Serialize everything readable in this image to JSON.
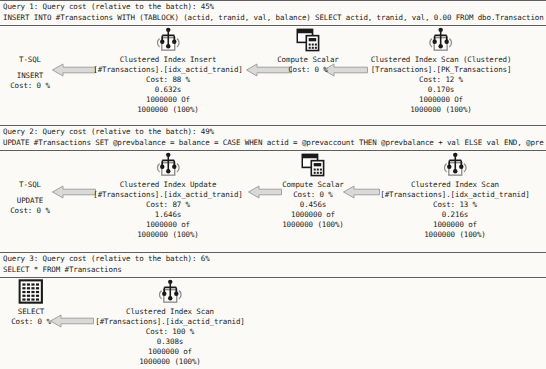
{
  "app": {
    "title": "SSMS graphical execution plan",
    "batch_query_count": 3
  },
  "colors": {
    "background": "#fbfaf6",
    "text": "#1b1b1b",
    "separator": "#5f5f5f",
    "arrow_fill": "#d9dad7",
    "arrow_stroke": "#9a9a98",
    "icon_ink": "#1a1a1a",
    "icon_box": "#8f8f8f"
  },
  "icons": {
    "clustered-index": "clustered-index-icon",
    "compute-scalar": "compute-scalar-icon",
    "result-table": "result-table-icon",
    "tsql": "tsql-icon"
  },
  "queries": [
    {
      "header": "Query 1: Query cost (relative to the batch): 45%",
      "sql": "INSERT INTO #Transactions WITH (TABLOCK) (actid, tranid, val, balance) SELECT actid, tranid, val, 0.00 FROM dbo.Transaction",
      "plan": {
        "height": 99,
        "nodes": [
          {
            "name": "tsql-insert-root-node",
            "icon": "tsql",
            "x": 30,
            "lines": [
              "T-SQL",
              "",
              "INSERT",
              "Cost: 0 %"
            ]
          },
          {
            "name": "clustered-index-insert-node",
            "icon": "clustered-index",
            "x": 168,
            "lines": [
              "Clustered Index Insert",
              "[#Transactions].[idx_actid_tranid]",
              "Cost: 88 %",
              "0.632s",
              "1000000 Of",
              "1000000 (100%)"
            ]
          },
          {
            "name": "compute-scalar-node",
            "icon": "compute-scalar",
            "x": 308,
            "lines": [
              "Compute Scalar",
              "Cost: 0 %"
            ]
          },
          {
            "name": "clustered-index-scan-node",
            "icon": "clustered-index",
            "x": 441,
            "lines": [
              "Clustered Index Scan (Clustered)",
              "[Transactions].[PK_Transactions]",
              "Cost: 12 %",
              "0.170s",
              "1000000 Of",
              "1000000 (100%)"
            ]
          }
        ],
        "arrows": [
          {
            "x": 52,
            "y": 37,
            "width": 44
          },
          {
            "x": 246,
            "y": 37,
            "width": 46
          },
          {
            "x": 323,
            "y": 37,
            "width": 45
          }
        ]
      }
    },
    {
      "header": "Query 2: Query cost (relative to the batch): 49%",
      "sql": "UPDATE #Transactions SET @prevbalance = balance = CASE WHEN actid = @prevaccount THEN @prevbalance + val ELSE val END, @pre",
      "plan": {
        "height": 101,
        "nodes": [
          {
            "name": "tsql-update-root-node",
            "icon": "tsql",
            "x": 30,
            "lines": [
              "T-SQL",
              "",
              "UPDATE",
              "Cost: 0 %"
            ]
          },
          {
            "name": "clustered-index-update-node",
            "icon": "clustered-index",
            "x": 168,
            "lines": [
              "Clustered Index Update",
              "[#Transactions].[idx_actid_tranid]",
              "Cost: 87 %",
              "1.646s",
              "1000000 of",
              "1000000 (100%)"
            ]
          },
          {
            "name": "compute-scalar-node",
            "icon": "compute-scalar",
            "x": 313,
            "lines": [
              "Compute Scalar",
              "Cost: 0 %",
              "0.456s",
              "1000000 of",
              "1000000 (100%)"
            ]
          },
          {
            "name": "clustered-index-scan-node",
            "icon": "clustered-index",
            "x": 455,
            "lines": [
              "Clustered Index Scan",
              "[#Transactions].[idx_actid_tranid]",
              "Cost: 13 %",
              "0.216s",
              "1000000 of",
              "1000000 (100%)"
            ]
          }
        ],
        "arrows": [
          {
            "x": 52,
            "y": 34,
            "width": 44
          },
          {
            "x": 248,
            "y": 34,
            "width": 34
          },
          {
            "x": 343,
            "y": 34,
            "width": 37
          }
        ]
      }
    },
    {
      "header": "Query 3: Query cost (relative to the batch): 6%",
      "sql": "SELECT * FROM #Transactions",
      "plan": {
        "height": 90,
        "nodes": [
          {
            "name": "select-result-root-node",
            "icon": "result-table",
            "x": 31,
            "lines": [
              "SELECT",
              "Cost: 0 %"
            ]
          },
          {
            "name": "clustered-index-scan-node",
            "icon": "clustered-index",
            "x": 170,
            "lines": [
              "Clustered Index Scan",
              "[#Transactions].[idx_actid_tranid]",
              "Cost: 100 %",
              "0.308s",
              "1000000 of",
              "1000000 (100%)"
            ]
          }
        ],
        "arrows": [
          {
            "x": 50,
            "y": 36,
            "width": 44
          }
        ]
      }
    }
  ]
}
